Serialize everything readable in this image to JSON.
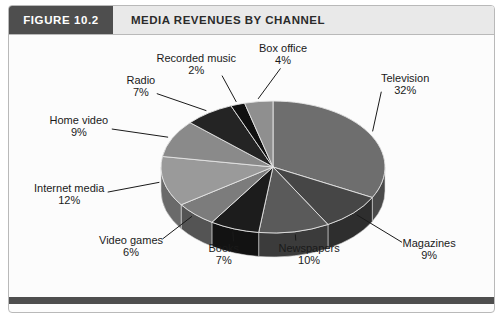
{
  "figure": {
    "number_label": "FIGURE 10.2",
    "title": "MEDIA REVENUES BY CHANNEL"
  },
  "colors": {
    "header_block_bg": "#4e4e4e",
    "header_title_bg": "#e9e9e9",
    "frame_border": "#b9b9b9",
    "body_bg": "#fcfcfc",
    "leader_line": "#1a1a1a"
  },
  "chart_data": {
    "type": "pie",
    "title": "MEDIA REVENUES BY CHANNEL",
    "subtitle": "",
    "xlabel": "",
    "ylabel": "",
    "value_unit": "%",
    "three_d": true,
    "legend_position": "none",
    "labels_position": "outside-with-leader-lines",
    "total": 98,
    "categories": [
      "Television",
      "Magazines",
      "Newspapers",
      "Books",
      "Video games",
      "Internet media",
      "Home video",
      "Radio",
      "Recorded music",
      "Box office"
    ],
    "values": [
      32,
      9,
      10,
      7,
      6,
      12,
      9,
      7,
      2,
      4
    ],
    "slices": [
      {
        "name": "Television",
        "value": 32,
        "label": "Television",
        "pct_text": "32%",
        "fill": "#6e6e6e",
        "side": "#4a4a4a"
      },
      {
        "name": "Magazines",
        "value": 9,
        "label": "Magazines",
        "pct_text": "9%",
        "fill": "#464646",
        "side": "#2e2e2e"
      },
      {
        "name": "Newspapers",
        "value": 10,
        "label": "Newspapers",
        "pct_text": "10%",
        "fill": "#5a5a5a",
        "side": "#3b3b3b"
      },
      {
        "name": "Books",
        "value": 7,
        "label": "Books",
        "pct_text": "7%",
        "fill": "#1c1c1c",
        "side": "#121212"
      },
      {
        "name": "Video games",
        "value": 6,
        "label": "Video games",
        "pct_text": "6%",
        "fill": "#7c7c7c",
        "side": "#545454"
      },
      {
        "name": "Internet media",
        "value": 12,
        "label": "Internet media",
        "pct_text": "12%",
        "fill": "#9a9a9a",
        "side": "#6a6a6a"
      },
      {
        "name": "Home video",
        "value": 9,
        "label": "Home video",
        "pct_text": "9%",
        "fill": "#8a8a8a",
        "side": "#5e5e5e"
      },
      {
        "name": "Radio",
        "value": 7,
        "label": "Radio",
        "pct_text": "7%",
        "fill": "#242424",
        "side": "#181818"
      },
      {
        "name": "Recorded music",
        "value": 2,
        "label": "Recorded music",
        "pct_text": "2%",
        "fill": "#101010",
        "side": "#0a0a0a"
      },
      {
        "name": "Box office",
        "value": 4,
        "label": "Box office",
        "pct_text": "4%",
        "fill": "#8f8f8f",
        "side": "#626262"
      }
    ]
  }
}
